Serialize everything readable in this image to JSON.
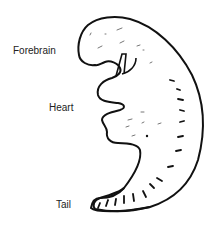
{
  "diagram": {
    "labels": [
      {
        "text": "Forebrain"
      },
      {
        "text": "Heart"
      },
      {
        "text": "Tail"
      }
    ],
    "stroke_color": "#111111",
    "background": "#ffffff"
  }
}
